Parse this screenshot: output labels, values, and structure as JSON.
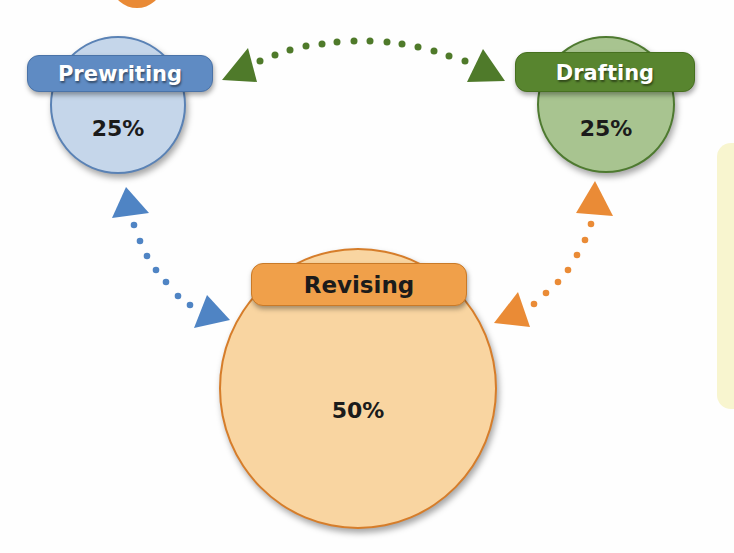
{
  "diagram": {
    "title": "",
    "stages": [
      {
        "id": "prewriting",
        "label": "Prewriting",
        "percent": "25%",
        "fill": "#c5d6ea",
        "accent": "#5f8bc3"
      },
      {
        "id": "drafting",
        "label": "Drafting",
        "percent": "25%",
        "fill": "#a8c490",
        "accent": "#58852f"
      },
      {
        "id": "revising",
        "label": "Revising",
        "percent": "50%",
        "fill": "#f9d5a1",
        "accent": "#f0a04a"
      }
    ],
    "connectors": [
      {
        "from": "prewriting",
        "to": "drafting",
        "style": "dotted",
        "bidirectional": true,
        "color": "#4f7a2a"
      },
      {
        "from": "prewriting",
        "to": "revising",
        "style": "dotted",
        "bidirectional": true,
        "color": "#4f84c4"
      },
      {
        "from": "drafting",
        "to": "revising",
        "style": "dotted",
        "bidirectional": true,
        "color": "#ea8b36"
      }
    ]
  }
}
